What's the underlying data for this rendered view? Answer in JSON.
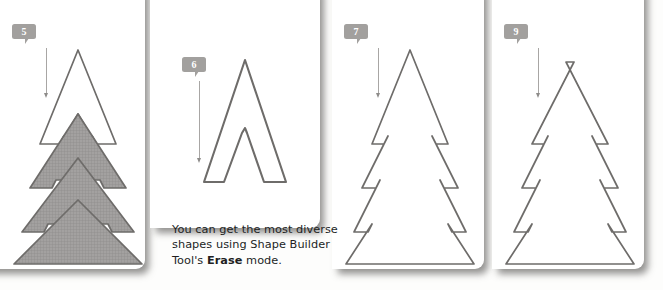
{
  "figure": {
    "type": "tutorial-step-diagram",
    "title_text": "",
    "background_color": "#fdfdfc",
    "badge_color": "#a2a09e",
    "stroke_color": "#6e6c6a",
    "fill_color": "#9b9997"
  },
  "panels": [
    {
      "id": "panel-5",
      "badge": "5",
      "description": "Christmas tree with top two tiers unfilled and lower three tiers filled with gray mesh",
      "shape_style": "partially-filled"
    },
    {
      "id": "panel-6",
      "badge": "6",
      "description": "Narrow outlined chevron / arrow shape remaining after erasing",
      "shape_style": "outline"
    },
    {
      "id": "panel-7",
      "badge": "7",
      "description": "Fully outlined Christmas tree with pointed top and three tiers",
      "shape_style": "outline"
    },
    {
      "id": "panel-9",
      "badge": "9",
      "description": "Outlined Christmas tree with notched top and three tiers",
      "shape_style": "outline"
    }
  ],
  "caption": {
    "line1": "You can get the most diverse",
    "line2_prefix": "shapes using Shape Builder",
    "line3_prefix": "Tool's ",
    "line3_bold": "Erase",
    "line3_suffix": " mode."
  },
  "icons": {
    "leader_arrow": "arrow-down-icon",
    "badge_tail": "callout-tail-icon"
  }
}
